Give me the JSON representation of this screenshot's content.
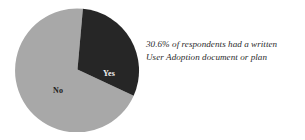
{
  "chart_data": {
    "type": "pie",
    "title": "",
    "subtitle": "",
    "xlabel": "",
    "ylabel": "",
    "categories": [
      "Yes",
      "No"
    ],
    "values": [
      30.6,
      69.4
    ],
    "units": "percent",
    "slices": [
      {
        "label": "Yes",
        "value": 30.6,
        "color": "#262626",
        "label_color": "#f2f2f2",
        "start_angle_deg": 5,
        "end_angle_deg": 115
      },
      {
        "label": "No",
        "value": 69.4,
        "color": "#a8a8a8",
        "label_color": "#1d1d1d",
        "start_angle_deg": 115,
        "end_angle_deg": 365
      }
    ],
    "legend": "none",
    "grid": false,
    "annotations": [
      "30.6% of respondents had a written",
      "User Adoption document or plan"
    ]
  },
  "pie": {
    "center_x": 62.5,
    "center_y": 62.5,
    "radius": 62,
    "background": "#ffffff",
    "slice_yes": {
      "label": "Yes",
      "color": "#262626",
      "path": "M 62.5 62.5 L 67.90 1.74 A 62 62 0 0 1 118.68 88.69 Z"
    },
    "slice_no": {
      "label": "No",
      "color": "#a8a8a8",
      "path": "M 62.5 62.5 L 118.68 88.69 A 62 62 0 1 1 67.90 1.74 Z"
    }
  },
  "annotation": {
    "line1": "30.6% of respondents had a written",
    "line2": "User Adoption document or plan",
    "color": "#2b2b2b"
  }
}
